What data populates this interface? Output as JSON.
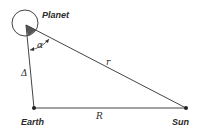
{
  "diagram": {
    "type": "triangle-geometry",
    "colors": {
      "line": "#444444",
      "fill": "#555555",
      "background": "#ffffff"
    },
    "points": {
      "planet": {
        "label": "Planet",
        "x": 26,
        "y": 25
      },
      "earth": {
        "label": "Earth",
        "x": 34,
        "y": 108
      },
      "sun": {
        "label": "Sun",
        "x": 186,
        "y": 108
      }
    },
    "sides": {
      "planet_earth": {
        "label": "Δ"
      },
      "planet_sun": {
        "label": "r"
      },
      "earth_sun": {
        "label": "R"
      }
    },
    "angles": {
      "at_planet": {
        "label": "α"
      }
    }
  }
}
